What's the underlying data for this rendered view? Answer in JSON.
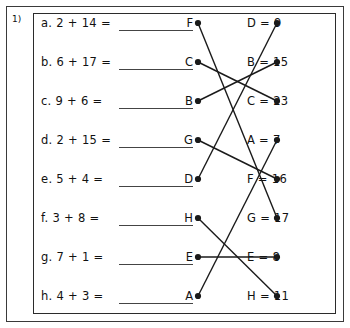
{
  "worksheet": {
    "question_number": "1)",
    "rows": [
      {
        "label": "a.",
        "problem": "a.  2 + 14 =",
        "left_letter": "F",
        "right_entry": "D = 9"
      },
      {
        "label": "b.",
        "problem": "b.  6 + 17 =",
        "left_letter": "C",
        "right_entry": "B = 15"
      },
      {
        "label": "c.",
        "problem": "c.  9 + 6 =",
        "left_letter": "B",
        "right_entry": "C = 23"
      },
      {
        "label": "d.",
        "problem": "d.  2 + 15 =",
        "left_letter": "G",
        "right_entry": "A = 7"
      },
      {
        "label": "e.",
        "problem": "e.  5 + 4 =",
        "left_letter": "D",
        "right_entry": "F = 16"
      },
      {
        "label": "f.",
        "problem": "f.  3 + 8 =",
        "left_letter": "H",
        "right_entry": "G = 17"
      },
      {
        "label": "g.",
        "problem": "g.  7 + 1 =",
        "left_letter": "E",
        "right_entry": "E = 8"
      },
      {
        "label": "h.",
        "problem": "h.  4 + 3 =",
        "left_letter": "A",
        "right_entry": "H = 11"
      }
    ],
    "connections": [
      {
        "from_row": 0,
        "to_row": 5,
        "from_letter": "F",
        "to_letter": "G = 17"
      },
      {
        "from_row": 1,
        "to_row": 2,
        "from_letter": "C",
        "to_letter": "C = 23"
      },
      {
        "from_row": 2,
        "to_row": 1,
        "from_letter": "B",
        "to_letter": "B = 15"
      },
      {
        "from_row": 3,
        "to_row": 4,
        "from_letter": "G",
        "to_letter": "F = 16"
      },
      {
        "from_row": 4,
        "to_row": 0,
        "from_letter": "D",
        "to_letter": "D = 9"
      },
      {
        "from_row": 5,
        "to_row": 7,
        "from_letter": "H",
        "to_letter": "H = 11"
      },
      {
        "from_row": 6,
        "to_row": 6,
        "from_letter": "E",
        "to_letter": "E = 8"
      },
      {
        "from_row": 7,
        "to_row": 3,
        "from_letter": "A",
        "to_letter": "A = 7"
      }
    ],
    "colors": {
      "ink": "#111111",
      "frame": "#2b2b2b",
      "outer_frame": "#3a3a3a",
      "line": "#1a1a1a",
      "blank_rule": "#444444"
    }
  }
}
